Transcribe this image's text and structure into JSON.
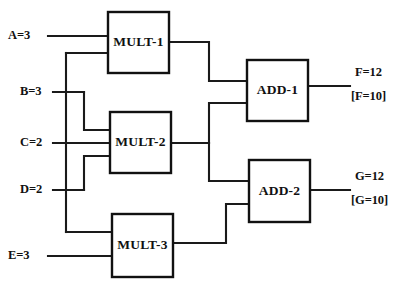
{
  "diagram": {
    "background_color": "#ffffff",
    "line_color": "#1a1a1a",
    "box_fill": "#ffffff",
    "box_stroke": "#111111"
  },
  "gates": [
    {
      "id": "mult1",
      "label": "MULT-1",
      "type": "multiplier",
      "x": 108,
      "y": 12,
      "w": 61,
      "h": 61
    },
    {
      "id": "mult2",
      "label": "MULT-2",
      "type": "multiplier",
      "x": 110,
      "y": 112,
      "w": 61,
      "h": 61
    },
    {
      "id": "mult3",
      "label": "MULT-3",
      "type": "multiplier",
      "x": 112,
      "y": 214,
      "w": 61,
      "h": 63
    },
    {
      "id": "add1",
      "label": "ADD-1",
      "type": "adder",
      "x": 247,
      "y": 60,
      "w": 61,
      "h": 61
    },
    {
      "id": "add2",
      "label": "ADD-2",
      "type": "adder",
      "x": 249,
      "y": 160,
      "w": 61,
      "h": 62
    }
  ],
  "inputs": [
    {
      "id": "A",
      "label": "A=3",
      "name": "A",
      "value": "3",
      "x": 8,
      "y": 36
    },
    {
      "id": "B",
      "label": "B=3",
      "name": "B",
      "value": "3",
      "x": 20,
      "y": 92
    },
    {
      "id": "C",
      "label": "C=2",
      "name": "C",
      "value": "2",
      "x": 20,
      "y": 143
    },
    {
      "id": "D",
      "label": "D=2",
      "name": "D",
      "value": "2",
      "x": 20,
      "y": 190
    },
    {
      "id": "E",
      "label": "E=3",
      "name": "E",
      "value": "3",
      "x": 8,
      "y": 256
    }
  ],
  "outputs": [
    {
      "id": "F",
      "label": "F=12",
      "bracket_label": "[F=10]",
      "name": "F",
      "value": "12",
      "bracket_value": "10",
      "x": 355,
      "y": 73,
      "bracket_y": 97
    },
    {
      "id": "G",
      "label": "G=12",
      "bracket_label": "[G=10]",
      "name": "G",
      "value": "12",
      "bracket_value": "10",
      "x": 355,
      "y": 177,
      "bracket_y": 201
    }
  ],
  "wires": [
    {
      "id": "wire-A-to-mult1",
      "from": "A",
      "to": "mult1-in1",
      "path": "M 48 36 L 108 36"
    },
    {
      "id": "wire-B-to-mult1",
      "from": "B",
      "to": "mult1-in2",
      "path": "M 66 53 L 108 53"
    },
    {
      "id": "wire-B-trunk-up",
      "from": "B",
      "to": "mult1-in2",
      "path": "M 66 53 L 66 232"
    },
    {
      "id": "wire-B-stub",
      "from": "B",
      "to": "junction",
      "path": "M 53 92 L 84 92"
    },
    {
      "id": "wire-B-down-to-mult2",
      "from": "B",
      "to": "mult2-in1",
      "path": "M 84 92 L 84 130 L 110 130"
    },
    {
      "id": "wire-C-to-mult2",
      "from": "C",
      "to": "mult2-in2",
      "path": "M 53 143 L 110 143"
    },
    {
      "id": "wire-D-stub",
      "from": "D",
      "to": "junction",
      "path": "M 53 190 L 84 190"
    },
    {
      "id": "wire-D-up-to-mult2",
      "from": "D",
      "to": "mult2-in2b",
      "path": "M 84 190 L 84 156 L 110 156"
    },
    {
      "id": "wire-trunk-to-mult3",
      "from": "B-trunk",
      "to": "mult3-in1",
      "path": "M 66 232 L 112 232"
    },
    {
      "id": "wire-E-to-mult3",
      "from": "E",
      "to": "mult3-in2",
      "path": "M 48 256 L 112 256"
    },
    {
      "id": "wire-mult1-to-add1",
      "from": "mult1",
      "to": "add1-in1",
      "path": "M 169 42 L 209 42 L 209 81 L 247 81"
    },
    {
      "id": "wire-mult2-out",
      "from": "mult2",
      "to": "split",
      "path": "M 171 143 L 209 143"
    },
    {
      "id": "wire-mult2-to-add1",
      "from": "mult2",
      "to": "add1-in2",
      "path": "M 209 143 L 209 103 L 247 103"
    },
    {
      "id": "wire-mult2-to-add2",
      "from": "mult2",
      "to": "add2-in1",
      "path": "M 209 143 L 209 181 L 249 181"
    },
    {
      "id": "wire-mult3-to-add2",
      "from": "mult3",
      "to": "add2-in2",
      "path": "M 173 243 L 226 243 L 226 204 L 249 204"
    },
    {
      "id": "wire-add1-to-F",
      "from": "add1",
      "to": "F",
      "path": "M 308 86 L 350 86"
    },
    {
      "id": "wire-add2-to-G",
      "from": "add2",
      "to": "G",
      "path": "M 310 190 L 350 190"
    }
  ]
}
